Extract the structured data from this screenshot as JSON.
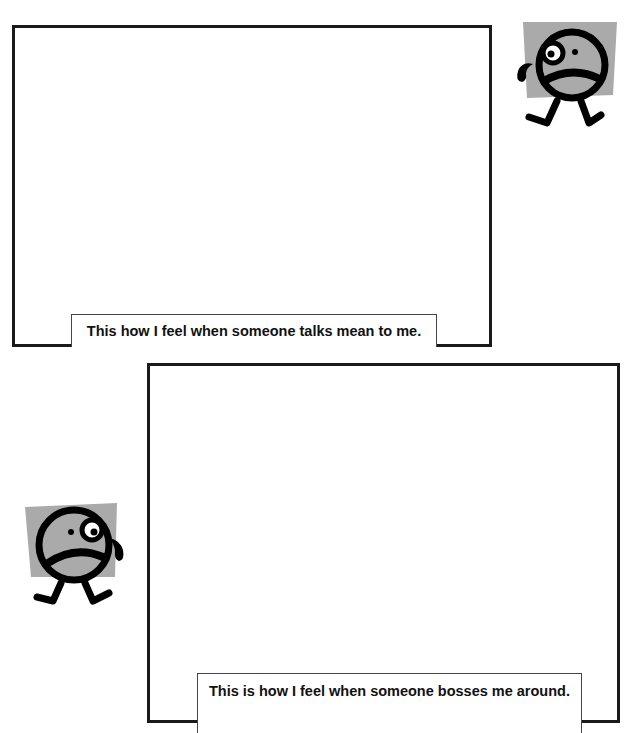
{
  "page": {
    "header_fragment": "",
    "background": "#ffffff"
  },
  "sections": [
    {
      "caption": "This how I feel when someone talks mean to me.",
      "drawing_area": "blank",
      "figure": {
        "icon": "sad-face-icon",
        "emotion": "sad",
        "position": "right"
      }
    },
    {
      "caption": "This is how I feel when someone bosses me around.",
      "drawing_area": "blank",
      "figure": {
        "icon": "sad-face-icon",
        "emotion": "sad",
        "position": "left"
      }
    }
  ],
  "colors": {
    "border": "#1a1a1a",
    "figure_bg": "#aaaaaa",
    "figure_line": "#000000"
  }
}
